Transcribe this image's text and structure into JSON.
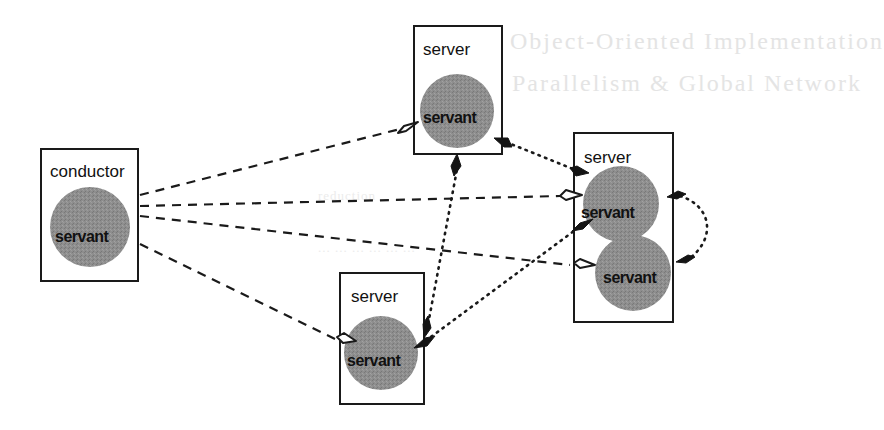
{
  "diagram": {
    "colors": {
      "background": "#ffffff",
      "stroke": "#1a1a1a",
      "servant_fill": "#8c8c8c",
      "bleed_text": "#e4e4e4"
    },
    "nodes": {
      "conductor": {
        "label": "conductor",
        "servants": [
          {
            "label": "servant"
          }
        ]
      },
      "server_top": {
        "label": "server",
        "servants": [
          {
            "label": "servant"
          }
        ]
      },
      "server_right": {
        "label": "server",
        "servants": [
          {
            "label": "servant"
          },
          {
            "label": "servant"
          }
        ]
      },
      "server_bottom": {
        "label": "server",
        "servants": [
          {
            "label": "servant"
          }
        ]
      }
    },
    "edges": [
      {
        "from": "conductor",
        "to": "server_top",
        "style": "dashed",
        "arrowhead": "hollow"
      },
      {
        "from": "conductor",
        "to": "server_right.servant_1",
        "style": "dashed",
        "arrowhead": "hollow"
      },
      {
        "from": "conductor",
        "to": "server_right.servant_2",
        "style": "dashed",
        "arrowhead": "hollow"
      },
      {
        "from": "conductor",
        "to": "server_bottom",
        "style": "dashed",
        "arrowhead": "hollow"
      },
      {
        "from": "server_top",
        "to": "server_right",
        "style": "dotted",
        "arrowhead": "filled",
        "bidirectional": true
      },
      {
        "from": "server_top",
        "to": "server_bottom",
        "style": "dotted",
        "arrowhead": "filled",
        "bidirectional": true
      },
      {
        "from": "server_bottom",
        "to": "server_right",
        "style": "dotted",
        "arrowhead": "filled",
        "bidirectional": true
      },
      {
        "from": "server_right.servant_1",
        "to": "server_right.servant_2",
        "style": "dotted",
        "arrowhead": "filled",
        "bidirectional": true
      }
    ],
    "legend": {
      "dashed": "conductor-to-servant link",
      "dotted": "servant-to-servant link"
    }
  },
  "bleed_through": {
    "line1": "Object-Oriented Implementation",
    "line2": "Parallelism & Global Network",
    "line3": "reduction",
    "line4": "... ... ... ... ... ..."
  }
}
